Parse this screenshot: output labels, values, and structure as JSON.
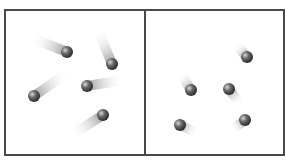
{
  "diagram": {
    "colors": {
      "border": "#4a4a4a",
      "particle": "#555555",
      "trail": "#9a9a9a"
    },
    "panels": [
      {
        "name": "left-panel-fast",
        "particles": [
          {
            "x": 67,
            "y": 52,
            "tx": 32,
            "ty": 38
          },
          {
            "x": 112,
            "y": 64,
            "tx": 98,
            "ty": 30
          },
          {
            "x": 34,
            "y": 96,
            "tx": 67,
            "ty": 73
          },
          {
            "x": 87,
            "y": 86,
            "tx": 124,
            "ty": 80
          },
          {
            "x": 103,
            "y": 115,
            "tx": 72,
            "ty": 135
          }
        ]
      },
      {
        "name": "right-panel-slow",
        "particles": [
          {
            "x": 247,
            "y": 57,
            "tx": 236,
            "ty": 45
          },
          {
            "x": 191,
            "y": 90,
            "tx": 181,
            "ty": 74
          },
          {
            "x": 229,
            "y": 89,
            "tx": 240,
            "ty": 104
          },
          {
            "x": 180,
            "y": 125,
            "tx": 197,
            "ty": 133
          },
          {
            "x": 245,
            "y": 120,
            "tx": 232,
            "ty": 130
          }
        ]
      }
    ]
  }
}
